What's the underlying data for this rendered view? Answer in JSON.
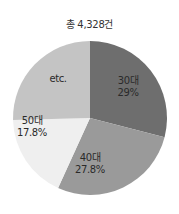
{
  "chart_data": {
    "type": "pie",
    "title": "총 4,328건",
    "total": 4328,
    "start_angle": "12 o'clock, clockwise",
    "slices": [
      {
        "label": "30대",
        "value": 29.0,
        "display": "29%",
        "color": "#6e6e6e"
      },
      {
        "label": "40대",
        "value": 27.8,
        "display": "27.8%",
        "color": "#9a9a9a"
      },
      {
        "label": "50대",
        "value": 17.8,
        "display": "17.8%",
        "color": "#efefef"
      },
      {
        "label": "etc.",
        "value": 25.4,
        "display": "",
        "color": "#c4c4c4"
      }
    ],
    "legend": "none (labels inside slices)"
  }
}
